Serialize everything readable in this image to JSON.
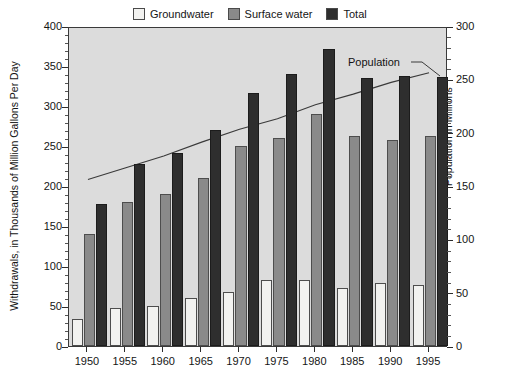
{
  "chart_data": {
    "type": "bar",
    "title": "",
    "subtitle": "",
    "categories": [
      "1950",
      "1955",
      "1960",
      "1965",
      "1970",
      "1975",
      "1980",
      "1985",
      "1990",
      "1995"
    ],
    "series": [
      {
        "name": "Groundwater",
        "axis": "left",
        "color": "#f2f2f0",
        "values": [
          34,
          47,
          50,
          60,
          68,
          82,
          83,
          73,
          79,
          76
        ]
      },
      {
        "name": "Surface water",
        "axis": "left",
        "color": "#8a8a8a",
        "values": [
          140,
          180,
          190,
          210,
          250,
          260,
          290,
          263,
          258,
          263
        ]
      },
      {
        "name": "Total",
        "axis": "left",
        "color": "#2e2e2e",
        "values": [
          178,
          228,
          241,
          270,
          316,
          340,
          371,
          335,
          338,
          336
        ]
      }
    ],
    "line_series": [
      {
        "name": "Population",
        "axis": "right",
        "color": "#3a3a3a",
        "x": [
          "1950",
          "1955",
          "1960",
          "1965",
          "1970",
          "1975",
          "1980",
          "1985",
          "1990",
          "1995"
        ],
        "values": [
          158,
          169,
          180,
          193,
          205,
          215,
          228,
          238,
          249,
          258
        ]
      }
    ],
    "xlabel": "",
    "ylabel": "Withdrawals, in Thousands of Million Gallons Per Day",
    "y2label": "Population in Millions",
    "ylim": [
      0,
      400
    ],
    "y2lim": [
      0,
      300
    ],
    "yticks": [
      0,
      50,
      100,
      150,
      200,
      250,
      300,
      350,
      400
    ],
    "y2ticks": [
      0,
      50,
      100,
      150,
      200,
      250,
      300
    ],
    "yticklabels": [
      "0",
      "50",
      "100",
      "150",
      "200",
      "250",
      "300",
      "350",
      "400"
    ],
    "y2ticklabels": [
      "0",
      "50",
      "100",
      "150",
      "200",
      "250",
      "300"
    ],
    "y_minor_step": 10,
    "y2_minor_step": 10,
    "grid": false,
    "plot_background": "#dcdcdc",
    "legend_position": "top-center",
    "annotations": [
      {
        "text": "Population",
        "x": 348,
        "y": 56
      }
    ]
  },
  "legend": {
    "items": [
      {
        "label": "Groundwater",
        "color": "#f2f2f0"
      },
      {
        "label": "Surface water",
        "color": "#8a8a8a"
      },
      {
        "label": "Total",
        "color": "#2e2e2e"
      }
    ]
  },
  "axes": {
    "left_title": "Withdrawals, in Thousands of Million Gallons Per Day",
    "right_title": "Population in Millions"
  }
}
